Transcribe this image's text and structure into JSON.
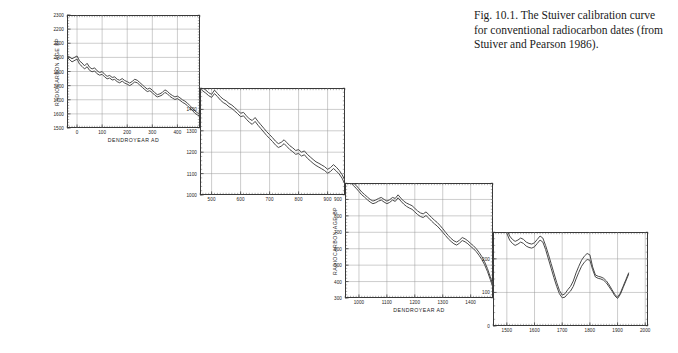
{
  "caption": {
    "text": "Fig. 10.1. The Stuiver calibration curve for conventional radiocarbon dates (from Stuiver and Pearson 1986)."
  },
  "chart_data": {
    "type": "line",
    "title": "Stuiver calibration curve for conventional radiocarbon dates",
    "xlabel": "DENDROYEAR AD",
    "ylabel": "RADIOCARBON AGE BP",
    "grid": true,
    "legend": "none",
    "note": "Four stepped panels; each panel plots a twin-trace band (upper and lower calibration line) of radiocarbon age versus dendro-year.",
    "panels": [
      {
        "id": "panel-1",
        "xlabel": "DENDROYEAR AD",
        "ylabel": "RADIOCARBON AGE BP",
        "xlim": [
          -40,
          490
        ],
        "ylim": [
          1500,
          2300
        ],
        "xticks": [
          0,
          100,
          200,
          300,
          400
        ],
        "yticks": [
          1500,
          1600,
          1700,
          1800,
          1900,
          2000,
          2100,
          2200,
          2300
        ],
        "series": [
          {
            "name": "upper-trace",
            "x": [
              -40,
              -20,
              0,
              10,
              20,
              30,
              40,
              50,
              60,
              70,
              80,
              90,
              100,
              110,
              120,
              130,
              140,
              150,
              160,
              170,
              180,
              190,
              200,
              210,
              220,
              230,
              240,
              250,
              260,
              270,
              280,
              290,
              300,
              310,
              320,
              330,
              340,
              350,
              360,
              370,
              380,
              390,
              400,
              410,
              420,
              430,
              440,
              450,
              460,
              470,
              480,
              490
            ],
            "y": [
              2015,
              1990,
              2010,
              1975,
              1960,
              1940,
              1958,
              1930,
              1918,
              1926,
              1905,
              1893,
              1900,
              1880,
              1866,
              1872,
              1858,
              1862,
              1845,
              1838,
              1850,
              1836,
              1828,
              1818,
              1830,
              1845,
              1838,
              1822,
              1806,
              1790,
              1775,
              1782,
              1768,
              1750,
              1736,
              1742,
              1752,
              1770,
              1760,
              1742,
              1730,
              1720,
              1726,
              1714,
              1700,
              1690,
              1676,
              1658,
              1640,
              1620,
              1608,
              1600
            ]
          },
          {
            "name": "lower-trace",
            "x": [
              -40,
              -20,
              0,
              10,
              20,
              30,
              40,
              50,
              60,
              70,
              80,
              90,
              100,
              110,
              120,
              130,
              140,
              150,
              160,
              170,
              180,
              190,
              200,
              210,
              220,
              230,
              240,
              250,
              260,
              270,
              280,
              290,
              300,
              310,
              320,
              330,
              340,
              350,
              360,
              370,
              380,
              390,
              400,
              410,
              420,
              430,
              440,
              450,
              460,
              470,
              480,
              490
            ],
            "y": [
              2002,
              1968,
              1988,
              1952,
              1936,
              1918,
              1934,
              1908,
              1898,
              1904,
              1884,
              1874,
              1880,
              1862,
              1848,
              1854,
              1840,
              1844,
              1828,
              1820,
              1832,
              1818,
              1810,
              1800,
              1812,
              1826,
              1820,
              1804,
              1788,
              1772,
              1758,
              1764,
              1750,
              1732,
              1720,
              1726,
              1734,
              1752,
              1742,
              1724,
              1712,
              1702,
              1708,
              1696,
              1682,
              1672,
              1658,
              1640,
              1624,
              1604,
              1592,
              1584
            ]
          }
        ]
      },
      {
        "id": "panel-2",
        "xlabel": "",
        "ylabel": "",
        "xlim": [
          460,
          960
        ],
        "ylim": [
          1000,
          1500
        ],
        "xticks": [
          500,
          600,
          700,
          800,
          900
        ],
        "yticks": [
          1000,
          1100,
          1200,
          1300,
          1400
        ],
        "series": [
          {
            "name": "upper-trace",
            "x": [
              460,
              470,
              480,
              490,
              500,
              510,
              520,
              530,
              540,
              550,
              560,
              570,
              580,
              590,
              600,
              610,
              620,
              630,
              640,
              650,
              660,
              670,
              680,
              690,
              700,
              710,
              720,
              730,
              740,
              750,
              760,
              770,
              780,
              790,
              800,
              810,
              820,
              830,
              840,
              850,
              860,
              870,
              880,
              890,
              900,
              910,
              920,
              930,
              940,
              950,
              960
            ],
            "y": [
              1512,
              1500,
              1490,
              1478,
              1470,
              1490,
              1475,
              1460,
              1448,
              1440,
              1428,
              1420,
              1408,
              1396,
              1382,
              1386,
              1370,
              1356,
              1348,
              1362,
              1344,
              1328,
              1312,
              1296,
              1282,
              1268,
              1252,
              1240,
              1246,
              1258,
              1244,
              1230,
              1220,
              1208,
              1212,
              1200,
              1206,
              1190,
              1178,
              1166,
              1155,
              1148,
              1140,
              1132,
              1120,
              1128,
              1142,
              1130,
              1115,
              1095,
              1068
            ]
          },
          {
            "name": "lower-trace",
            "x": [
              460,
              470,
              480,
              490,
              500,
              510,
              520,
              530,
              540,
              550,
              560,
              570,
              580,
              590,
              600,
              610,
              620,
              630,
              640,
              650,
              660,
              670,
              680,
              690,
              700,
              710,
              720,
              730,
              740,
              750,
              760,
              770,
              780,
              790,
              800,
              810,
              820,
              830,
              840,
              850,
              860,
              870,
              880,
              890,
              900,
              910,
              920,
              930,
              940,
              950,
              960
            ],
            "y": [
              1498,
              1486,
              1476,
              1464,
              1456,
              1474,
              1460,
              1444,
              1432,
              1424,
              1412,
              1404,
              1392,
              1380,
              1366,
              1370,
              1354,
              1340,
              1330,
              1344,
              1326,
              1310,
              1294,
              1278,
              1264,
              1250,
              1234,
              1222,
              1228,
              1240,
              1226,
              1212,
              1202,
              1190,
              1194,
              1182,
              1188,
              1172,
              1160,
              1148,
              1138,
              1130,
              1122,
              1114,
              1102,
              1110,
              1124,
              1112,
              1098,
              1078,
              1050
            ]
          }
        ]
      },
      {
        "id": "panel-3",
        "xlabel": "DENDROYEAR AD",
        "ylabel": "RADIOCARBON AGE BP",
        "xlim": [
          950,
          1480
        ],
        "ylim": [
          300,
          1000
        ],
        "xticks": [
          1000,
          1100,
          1200,
          1300,
          1400
        ],
        "yticks": [
          300,
          400,
          500,
          600,
          700,
          800,
          900
        ],
        "series": [
          {
            "name": "upper-trace",
            "x": [
              950,
              960,
              970,
              980,
              990,
              1000,
              1010,
              1020,
              1030,
              1040,
              1050,
              1060,
              1070,
              1080,
              1090,
              1100,
              1110,
              1120,
              1130,
              1140,
              1150,
              1160,
              1170,
              1180,
              1190,
              1200,
              1210,
              1220,
              1230,
              1240,
              1250,
              1260,
              1270,
              1280,
              1290,
              1300,
              1310,
              1320,
              1330,
              1340,
              1350,
              1360,
              1370,
              1380,
              1390,
              1400,
              1410,
              1420,
              1430,
              1440,
              1450,
              1460,
              1470,
              1480
            ],
            "y": [
              1040,
              1030,
              1018,
              1000,
              985,
              965,
              945,
              930,
              915,
              900,
              890,
              896,
              906,
              912,
              900,
              890,
              898,
              912,
              906,
              928,
              908,
              890,
              878,
              870,
              862,
              846,
              830,
              818,
              812,
              824,
              808,
              790,
              774,
              760,
              742,
              722,
              700,
              680,
              662,
              648,
              640,
              652,
              668,
              660,
              648,
              632,
              618,
              600,
              578,
              552,
              520,
              480,
              430,
              380
            ]
          },
          {
            "name": "lower-trace",
            "x": [
              950,
              960,
              970,
              980,
              990,
              1000,
              1010,
              1020,
              1030,
              1040,
              1050,
              1060,
              1070,
              1080,
              1090,
              1100,
              1110,
              1120,
              1130,
              1140,
              1150,
              1160,
              1170,
              1180,
              1190,
              1200,
              1210,
              1220,
              1230,
              1240,
              1250,
              1260,
              1270,
              1280,
              1290,
              1300,
              1310,
              1320,
              1330,
              1340,
              1350,
              1360,
              1370,
              1380,
              1390,
              1400,
              1410,
              1420,
              1430,
              1440,
              1450,
              1460,
              1470,
              1480
            ],
            "y": [
              1026,
              1014,
              1002,
              984,
              968,
              948,
              928,
              914,
              898,
              884,
              874,
              880,
              890,
              896,
              884,
              874,
              882,
              896,
              888,
              910,
              890,
              872,
              858,
              848,
              840,
              824,
              808,
              796,
              790,
              802,
              786,
              768,
              752,
              738,
              720,
              700,
              680,
              660,
              644,
              630,
              622,
              634,
              650,
              642,
              630,
              614,
              600,
              582,
              560,
              534,
              502,
              462,
              414,
              364
            ]
          }
        ]
      },
      {
        "id": "panel-4",
        "xlabel": "",
        "ylabel": "",
        "xlim": [
          1450,
          2010
        ],
        "ylim": [
          0,
          280
        ],
        "xticks": [
          1500,
          1600,
          1700,
          1800,
          1900,
          2000
        ],
        "yticks": [
          0,
          100,
          200
        ],
        "series": [
          {
            "name": "upper-trace",
            "x": [
              1450,
              1460,
              1470,
              1480,
              1490,
              1500,
              1510,
              1520,
              1530,
              1540,
              1550,
              1560,
              1570,
              1580,
              1590,
              1600,
              1610,
              1620,
              1630,
              1640,
              1650,
              1660,
              1670,
              1680,
              1690,
              1700,
              1710,
              1720,
              1730,
              1740,
              1750,
              1760,
              1770,
              1780,
              1790,
              1800,
              1810,
              1820,
              1830,
              1840,
              1850,
              1860,
              1870,
              1880,
              1890,
              1900,
              1910,
              1920,
              1930,
              1940
            ],
            "y": [
              385,
              352,
              330,
              316,
              302,
              288,
              268,
              258,
              252,
              256,
              262,
              258,
              250,
              246,
              244,
              248,
              258,
              268,
              262,
              240,
              214,
              186,
              158,
              130,
              106,
              92,
              96,
              108,
              118,
              134,
              158,
              178,
              196,
              208,
              216,
              212,
              176,
              152,
              148,
              146,
              142,
              134,
              122,
              108,
              94,
              86,
              98,
              118,
              138,
              158
            ]
          },
          {
            "name": "lower-trace",
            "x": [
              1450,
              1460,
              1470,
              1480,
              1490,
              1500,
              1510,
              1520,
              1530,
              1540,
              1550,
              1560,
              1570,
              1580,
              1590,
              1600,
              1610,
              1620,
              1630,
              1640,
              1650,
              1660,
              1670,
              1680,
              1690,
              1700,
              1710,
              1720,
              1730,
              1740,
              1750,
              1760,
              1770,
              1780,
              1790,
              1800,
              1810,
              1820,
              1830,
              1840,
              1850,
              1860,
              1870,
              1880,
              1890,
              1900,
              1910,
              1920,
              1930,
              1940
            ],
            "y": [
              372,
              340,
              318,
              304,
              290,
              276,
              256,
              246,
              240,
              244,
              250,
              246,
              238,
              234,
              232,
              236,
              246,
              256,
              250,
              228,
              200,
              172,
              144,
              118,
              96,
              84,
              86,
              96,
              104,
              118,
              140,
              160,
              178,
              190,
              198,
              196,
              168,
              146,
              142,
              140,
              136,
              128,
              116,
              104,
              90,
              82,
              94,
              114,
              134,
              154
            ]
          }
        ]
      }
    ]
  },
  "colors": {
    "axis": "#3a3a3a",
    "grid": "#9a9a9a",
    "trace": "#4a4a4a",
    "text": "#222222",
    "background": "#ffffff"
  }
}
